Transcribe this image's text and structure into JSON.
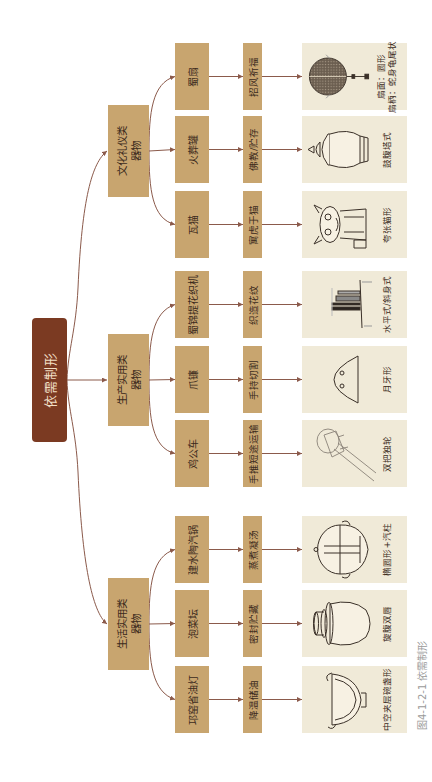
{
  "diagram": {
    "root": {
      "label": "依需制形"
    },
    "categories": [
      {
        "label_line1": "生活实用类",
        "label_line2": "器物",
        "items": [
          {
            "name": "邛窑省油灯",
            "function": "降温储油",
            "shape": [
              "中空夹层碗盏形"
            ]
          },
          {
            "name": "泡菜坛",
            "function": "密封贮藏",
            "shape": [
              "旋腹双唇"
            ]
          },
          {
            "name": "建水陶汽锅",
            "function": "蒸煮凝汤",
            "shape": [
              "椭圆形+汽柱"
            ]
          }
        ]
      },
      {
        "label_line1": "生产实用类",
        "label_line2": "器物",
        "items": [
          {
            "name": "鸡公车",
            "function": "手推短途运输",
            "shape": [
              "双把独轮"
            ]
          },
          {
            "name": "爪镰",
            "function": "手持切割",
            "shape": [
              "月牙形"
            ]
          },
          {
            "name": "蜀锦提花织机",
            "function": "织造花纹",
            "shape": [
              "水平式/斜身式"
            ]
          }
        ]
      },
      {
        "label_line1": "文化礼仪类",
        "label_line2": "器物",
        "items": [
          {
            "name": "瓦猫",
            "function": "寓虎于猫",
            "shape": [
              "夸张猫形"
            ]
          },
          {
            "name": "火葬罐",
            "function": "佛教/贮存",
            "shape": [
              "鼓腹塔式"
            ]
          },
          {
            "name": "蜀扇",
            "function": "招风祈福",
            "shape": [
              "扇面：圆形",
              "扇柄：蛇身龟尾状"
            ]
          }
        ]
      }
    ]
  },
  "caption": "图4-1-2-1  依需制形",
  "colors": {
    "root_fill": "#7b3a22",
    "root_text": "#f1dfc5",
    "box_fill": "#c8a56f",
    "panel_fill": "#f0ead8",
    "connector": "#8b5a4b",
    "caption_text": "#9a9a9a"
  }
}
